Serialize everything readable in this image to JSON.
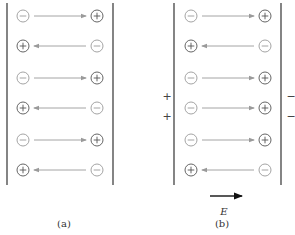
{
  "figure": {
    "panels": [
      {
        "id": "a",
        "caption": "(a)",
        "plates": {
          "left_x": 7,
          "right_x": 113,
          "top_y": 3,
          "bottom_y": 185
        },
        "atom_x": {
          "left": 23,
          "right": 97
        },
        "dipoles": [
          {
            "y": 16,
            "left": "−",
            "right": "+",
            "direction": "right"
          },
          {
            "y": 46,
            "left": "+",
            "right": "−",
            "direction": "left"
          },
          {
            "y": 78,
            "left": "−",
            "right": "+",
            "direction": "right"
          },
          {
            "y": 108,
            "left": "+",
            "right": "−",
            "direction": "left"
          },
          {
            "y": 140,
            "left": "−",
            "right": "+",
            "direction": "right"
          },
          {
            "y": 170,
            "left": "+",
            "right": "−",
            "direction": "left"
          }
        ]
      },
      {
        "id": "b",
        "caption": "(b)",
        "plates": {
          "left_x": 174,
          "right_x": 281,
          "top_y": 3,
          "bottom_y": 185
        },
        "atom_x": {
          "left": 191,
          "right": 265
        },
        "dipoles": [
          {
            "y": 16,
            "left": "−",
            "right": "+",
            "direction": "right"
          },
          {
            "y": 46,
            "left": "+",
            "right": "−",
            "direction": "left"
          },
          {
            "y": 78,
            "left": "−",
            "right": "+",
            "direction": "right"
          },
          {
            "y": 108,
            "left": "−",
            "right": "+",
            "direction": "right"
          },
          {
            "y": 140,
            "left": "−",
            "right": "+",
            "direction": "right"
          },
          {
            "y": 170,
            "left": "+",
            "right": "−",
            "direction": "left"
          }
        ],
        "left_plate_charges": [
          "+",
          "+"
        ],
        "right_plate_charges": [
          "−",
          "−"
        ],
        "field": {
          "label": "E",
          "direction": "right"
        }
      }
    ],
    "colors": {
      "plate": "#333333",
      "positive_atom": "#555555",
      "negative_atom": "#9a9a9a",
      "dipole_arrow": "#9a9a9a",
      "field_arrow": "#111111"
    }
  }
}
